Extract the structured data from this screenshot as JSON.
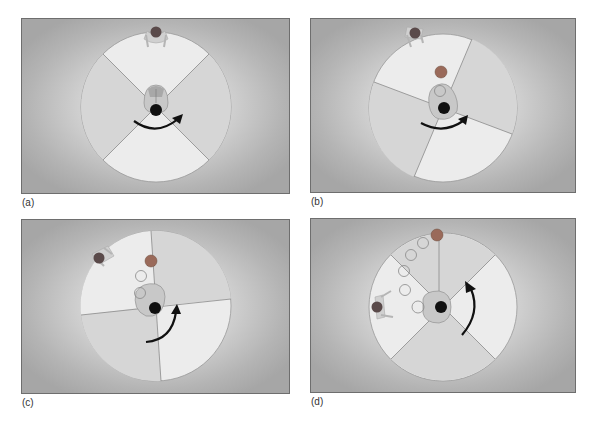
{
  "figure": {
    "panels": [
      {
        "id": "a",
        "label": "(a)",
        "rotation_direction": "clockwise",
        "wedge_offset_deg": 45,
        "ball": null,
        "ghost_ball_count": 0,
        "partner_position": "top"
      },
      {
        "id": "b",
        "label": "(b)",
        "rotation_direction": "clockwise",
        "wedge_offset_deg": 20,
        "ball": "thrown",
        "ghost_ball_count": 1,
        "partner_position": "top-left"
      },
      {
        "id": "c",
        "label": "(c)",
        "rotation_direction": "counterclockwise-up",
        "wedge_offset_deg": -4,
        "ball": "thrown",
        "ghost_ball_count": 2,
        "partner_position": "upper-left"
      },
      {
        "id": "d",
        "label": "(d)",
        "rotation_direction": "counterclockwise-up",
        "wedge_offset_deg": 45,
        "ball": "thrown",
        "ghost_ball_count": 5,
        "partner_position": "left"
      }
    ],
    "colors": {
      "wedge_light": "#ececec",
      "wedge_dark": "#d6d6d6",
      "wedge_line": "#8a8a8a",
      "head_dark": "#101010",
      "ball": "#9a6a5a",
      "partner_head": "#5a4a4a",
      "arrow": "#111111"
    }
  }
}
